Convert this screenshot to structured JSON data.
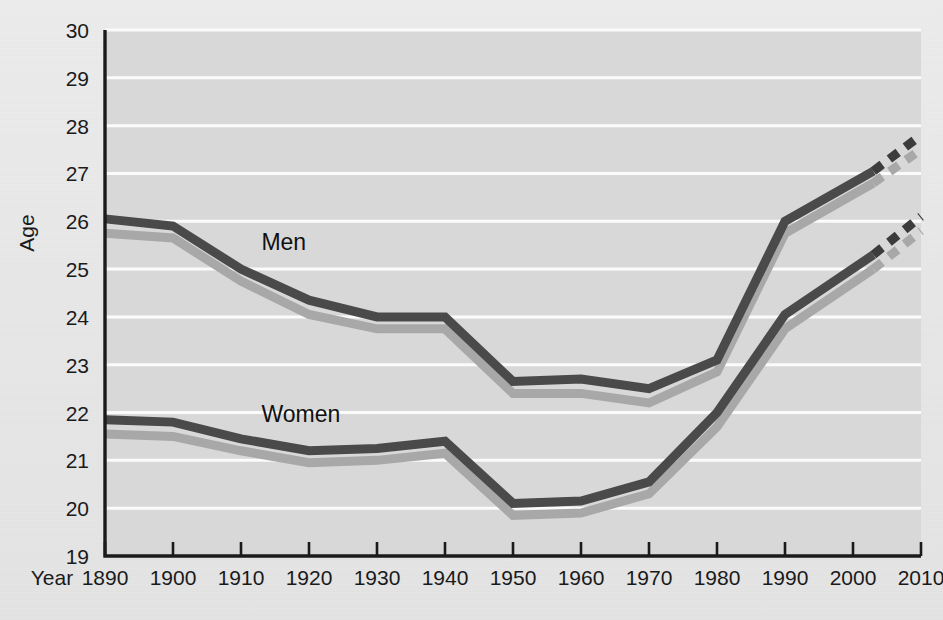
{
  "chart_data": {
    "type": "line",
    "title": "",
    "xlabel": "Year",
    "ylabel": "Age",
    "xlim": [
      1890,
      2010
    ],
    "ylim": [
      19,
      30
    ],
    "x_ticks": [
      1890,
      1900,
      1910,
      1920,
      1930,
      1940,
      1950,
      1960,
      1970,
      1980,
      1990,
      2000,
      2010
    ],
    "y_ticks": [
      19,
      20,
      21,
      22,
      23,
      24,
      25,
      26,
      27,
      28,
      29,
      30
    ],
    "grid": "horizontal",
    "legend_position": "inline-annotation",
    "annotations": [
      {
        "text": "Men",
        "x": 1913,
        "y": 25.4
      },
      {
        "text": "Women",
        "x": 1913,
        "y": 21.8
      }
    ],
    "series": [
      {
        "name": "Men",
        "style": "solid",
        "color": "#4a4a4a",
        "x": [
          1890,
          1900,
          1910,
          1920,
          1930,
          1940,
          1950,
          1960,
          1970,
          1980,
          1990,
          2003
        ],
        "values": [
          26.05,
          25.9,
          25.0,
          24.35,
          24.0,
          24.0,
          22.65,
          22.7,
          22.5,
          23.1,
          26.0,
          27.05
        ]
      },
      {
        "name": "Men (projected)",
        "style": "dashed",
        "color": "#3c3c3c",
        "x": [
          2003,
          2010
        ],
        "values": [
          27.05,
          27.8
        ]
      },
      {
        "name": "Women",
        "style": "solid",
        "color": "#4a4a4a",
        "x": [
          1890,
          1900,
          1910,
          1920,
          1930,
          1940,
          1950,
          1960,
          1970,
          1980,
          1990,
          2003
        ],
        "values": [
          21.85,
          21.8,
          21.45,
          21.2,
          21.25,
          21.4,
          20.1,
          20.15,
          20.55,
          22.0,
          24.05,
          25.3
        ]
      },
      {
        "name": "Women (projected)",
        "style": "dashed",
        "color": "#3c3c3c",
        "x": [
          2003,
          2010
        ],
        "values": [
          25.3,
          26.1
        ]
      },
      {
        "name": "Men (shadow)",
        "style": "solid",
        "color": "#a8a8a8",
        "x": [
          1890,
          1900,
          1910,
          1920,
          1930,
          1940,
          1950,
          1960,
          1970,
          1980,
          1990,
          2003
        ],
        "values": [
          25.75,
          25.65,
          24.75,
          24.05,
          23.75,
          23.75,
          22.4,
          22.4,
          22.2,
          22.85,
          25.75,
          26.8
        ]
      },
      {
        "name": "Men (shadow projected)",
        "style": "dashed",
        "color": "#a8a8a8",
        "x": [
          2003,
          2010
        ],
        "values": [
          26.8,
          27.5
        ]
      },
      {
        "name": "Women (shadow)",
        "style": "solid",
        "color": "#a8a8a8",
        "x": [
          1890,
          1900,
          1910,
          1920,
          1930,
          1940,
          1950,
          1960,
          1970,
          1980,
          1990,
          2003
        ],
        "values": [
          21.55,
          21.5,
          21.2,
          20.95,
          21.0,
          21.15,
          19.85,
          19.9,
          20.3,
          21.7,
          23.75,
          25.0
        ]
      },
      {
        "name": "Women (shadow projected)",
        "style": "dashed",
        "color": "#a8a8a8",
        "x": [
          2003,
          2010
        ],
        "values": [
          25.0,
          25.8
        ]
      }
    ]
  },
  "axes": {
    "y_label": "Age",
    "x_label": "Year",
    "y_tick_labels": [
      "30",
      "29",
      "28",
      "27",
      "26",
      "25",
      "24",
      "23",
      "22",
      "21",
      "20",
      "19"
    ],
    "x_tick_labels": [
      "1890",
      "1900",
      "1910",
      "1920",
      "1930",
      "1940",
      "1950",
      "1960",
      "1970",
      "1980",
      "1990",
      "2000",
      "2010"
    ]
  },
  "labels": {
    "men": "Men",
    "women": "Women"
  },
  "colors": {
    "page_background": "#e9e9e9",
    "plot_background": "#d8d8d8",
    "gridline": "#fbfbfb",
    "axis": "#1b1b1b",
    "series_primary": "#4a4a4a",
    "series_shadow": "#a8a8a8",
    "text": "#1a1a1a"
  }
}
